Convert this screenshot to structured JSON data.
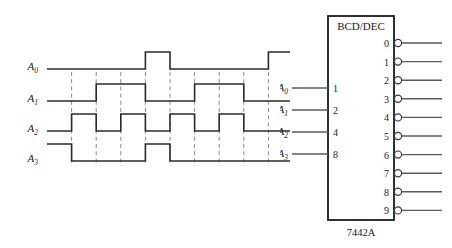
{
  "figure": {
    "type": "digital-timing-and-logic-symbol",
    "colors": {
      "waveform": "#2b2b2b",
      "gridline": "#8a8a8a",
      "chip_outline": "#1a1a1a",
      "lead": "#5a5a5a",
      "background": "#ffffff"
    }
  },
  "timing": {
    "signals": [
      {
        "name": "A0",
        "label_base": "A",
        "label_sub": "0",
        "weight": 1
      },
      {
        "name": "A1",
        "label_base": "A",
        "label_sub": "1",
        "weight": 2
      },
      {
        "name": "A2",
        "label_base": "A",
        "label_sub": "2",
        "weight": 4
      },
      {
        "name": "A3",
        "label_base": "A",
        "label_sub": "3",
        "weight": 8
      }
    ],
    "time_slots": 10,
    "gridline_count": 9,
    "chart_note": "Dashed vertical gridlines mark time-slot boundaries"
  },
  "chart_data": {
    "type": "line",
    "title": "",
    "xlabel": "",
    "ylabel": "",
    "subtype": "digital-timing-waveform",
    "x": [
      0,
      1,
      2,
      3,
      4,
      5,
      6,
      7,
      8,
      9,
      10
    ],
    "ylim": [
      0,
      1
    ],
    "grid": true,
    "legend_position": "left-axis-labels",
    "series": [
      {
        "name": "A0",
        "values": [
          0,
          0,
          0,
          0,
          1,
          0,
          0,
          0,
          0,
          1,
          0
        ]
      },
      {
        "name": "A1",
        "values": [
          0,
          0,
          1,
          1,
          0,
          0,
          1,
          1,
          0,
          0,
          0
        ]
      },
      {
        "name": "A2",
        "values": [
          0,
          1,
          0,
          1,
          0,
          1,
          0,
          1,
          0,
          0,
          0
        ]
      },
      {
        "name": "A3",
        "values": [
          1,
          0,
          0,
          0,
          1,
          0,
          0,
          0,
          0,
          0,
          0
        ]
      }
    ],
    "tick_labels": [
      "A0",
      "A1",
      "A2",
      "A3"
    ]
  },
  "chip": {
    "title": "BCD/DEC",
    "part_number": "7442A",
    "inputs": [
      {
        "label_base": "A",
        "label_sub": "0",
        "weight": "1"
      },
      {
        "label_base": "A",
        "label_sub": "1",
        "weight": "2"
      },
      {
        "label_base": "A",
        "label_sub": "2",
        "weight": "4"
      },
      {
        "label_base": "A",
        "label_sub": "3",
        "weight": "8"
      }
    ],
    "outputs": [
      {
        "number": "0",
        "active_low": true
      },
      {
        "number": "1",
        "active_low": true
      },
      {
        "number": "2",
        "active_low": true
      },
      {
        "number": "3",
        "active_low": true
      },
      {
        "number": "4",
        "active_low": true
      },
      {
        "number": "5",
        "active_low": true
      },
      {
        "number": "6",
        "active_low": true
      },
      {
        "number": "7",
        "active_low": true
      },
      {
        "number": "8",
        "active_low": true
      },
      {
        "number": "9",
        "active_low": true
      }
    ]
  }
}
